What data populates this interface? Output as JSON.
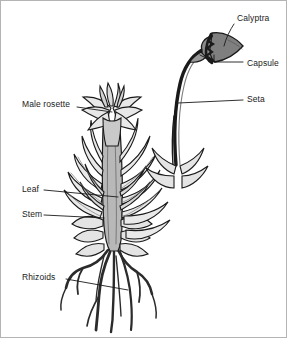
{
  "figure": {
    "background_color": "#ffffff",
    "border_color": "#b4b4b4",
    "ink_color": "#1a1a1a",
    "fills": {
      "leaf_light": "#e8e8e8",
      "leaf_mid": "#d2d2d2",
      "capsule_gray": "#8a8a8a",
      "calyptra_gray": "#7f7f7f",
      "stem_gray": "#9a9a9a",
      "rhizoid_dark": "#2b2b2b"
    }
  },
  "labels": [
    {
      "id": "calyptra",
      "text": "Calyptra",
      "x": 237,
      "y": 19
    },
    {
      "id": "capsule",
      "text": "Capsule",
      "x": 247,
      "y": 64
    },
    {
      "id": "seta",
      "text": "Seta",
      "x": 247,
      "y": 100
    },
    {
      "id": "male_rosette",
      "text": "Male rosette",
      "x": 22,
      "y": 105
    },
    {
      "id": "leaf",
      "text": "Leaf",
      "x": 22,
      "y": 190
    },
    {
      "id": "stem",
      "text": "Stem",
      "x": 22,
      "y": 215
    },
    {
      "id": "rhizoids",
      "text": "Rhizoids",
      "x": 22,
      "y": 278
    }
  ],
  "parts": [
    {
      "id": "calyptra",
      "name": "Calyptra",
      "description": "hood-like cap covering the right side of the spore capsule"
    },
    {
      "id": "capsule",
      "name": "Capsule",
      "description": "spore-bearing sac at the tip of the seta"
    },
    {
      "id": "seta",
      "name": "Seta",
      "description": "long arching stalk supporting the capsule"
    },
    {
      "id": "male_rosette",
      "name": "Male rosette",
      "description": "star-shaped cluster of leaves at the shoot apex"
    },
    {
      "id": "leaf",
      "name": "Leaf",
      "description": "lance-shaped overlapping leaves along the shoot"
    },
    {
      "id": "stem",
      "name": "Stem",
      "description": "central upright axis of the gametophyte"
    },
    {
      "id": "rhizoids",
      "name": "Rhizoids",
      "description": "branching root-like filaments anchoring the plant"
    }
  ]
}
